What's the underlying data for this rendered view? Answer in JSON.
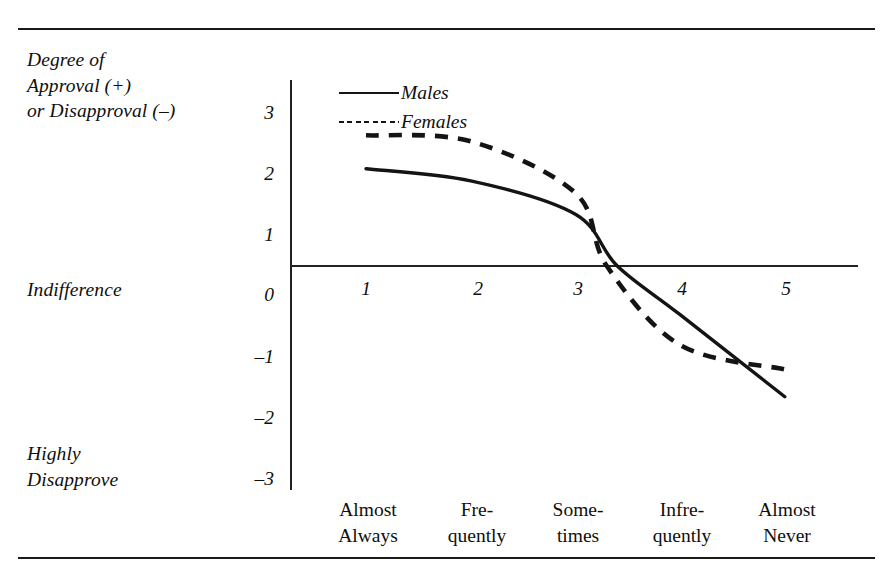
{
  "chart_data": {
    "type": "line",
    "title": "",
    "ylabel": "Degree of Approval (+) or Disapproval (–)",
    "xlabel": "",
    "ylim": [
      -3,
      3
    ],
    "yticks": [
      3,
      2,
      1,
      0,
      -1,
      -2,
      -3
    ],
    "xticks": [
      1,
      2,
      3,
      4,
      5
    ],
    "categories": [
      "Almost Always",
      "Frequently",
      "Sometimes",
      "Infrequently",
      "Almost Never"
    ],
    "grid": false,
    "legend_position": "top-left-inside",
    "series": [
      {
        "name": "Males",
        "style": "solid",
        "x": [
          1,
          2,
          3,
          3.4,
          4,
          5
        ],
        "values": [
          1.6,
          1.4,
          0.85,
          0.0,
          -0.8,
          -2.15
        ]
      },
      {
        "name": "Females",
        "style": "dashed",
        "x": [
          1,
          2,
          3,
          3.3,
          4,
          5
        ],
        "values": [
          2.15,
          2.05,
          1.2,
          0.0,
          -1.3,
          -1.7
        ]
      }
    ],
    "annotations": [
      {
        "text": "Indifference",
        "value": 0,
        "axis": "y"
      },
      {
        "text": "Highly Disapprove",
        "value": -3,
        "axis": "y"
      }
    ],
    "colors": {
      "line": "#151412",
      "axis": "#232220",
      "rule": "#1b1a18",
      "background": "#ffffff"
    }
  },
  "axis": {
    "ylabel_line1": "Degree of",
    "ylabel_line2": "Approval (+)",
    "ylabel_line3": "or Disapproval (–)",
    "indifference": "Indifference",
    "highly_line1": "Highly",
    "highly_line2": "Disapprove",
    "yticks": [
      "3",
      "2",
      "1",
      "0",
      "–1",
      "–2",
      "–3"
    ],
    "xticks": [
      "1",
      "2",
      "3",
      "4",
      "5"
    ]
  },
  "categories": [
    {
      "line1": "Almost",
      "line2": "Always"
    },
    {
      "line1": "Fre-",
      "line2": "quently"
    },
    {
      "line1": "Some-",
      "line2": "times"
    },
    {
      "line1": "Infre-",
      "line2": "quently"
    },
    {
      "line1": "Almost",
      "line2": "Never"
    }
  ],
  "legend": {
    "males": "Males",
    "females": "Females"
  }
}
